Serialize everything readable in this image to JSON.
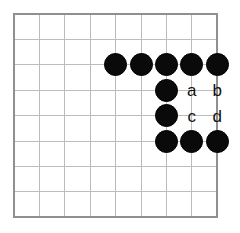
{
  "figure": {
    "kind": "go-board-diagram",
    "title": "",
    "caption": ""
  },
  "board": {
    "lines_x": 9,
    "lines_y": 9,
    "origin_x": 14,
    "origin_y": 14,
    "spacing": 25.4,
    "border_color": "#909090",
    "grid_color": "#bcbcbc",
    "background_color": "#ffffff",
    "border_width": 2,
    "grid_width": 1
  },
  "stones": {
    "diameter": 23,
    "black_color": "#0a0a0a",
    "white_color": "#ffffff",
    "items": [
      {
        "name": "stone-black-c4r2",
        "color": "black",
        "col": 4,
        "row": 2
      },
      {
        "name": "stone-black-c5r2",
        "color": "black",
        "col": 5,
        "row": 2
      },
      {
        "name": "stone-black-c6r2",
        "color": "black",
        "col": 6,
        "row": 2
      },
      {
        "name": "stone-black-c7r2",
        "color": "black",
        "col": 7,
        "row": 2
      },
      {
        "name": "stone-black-c8r2",
        "color": "black",
        "col": 8,
        "row": 2
      },
      {
        "name": "stone-black-c6r3",
        "color": "black",
        "col": 6,
        "row": 3
      },
      {
        "name": "stone-black-c6r4",
        "color": "black",
        "col": 6,
        "row": 4
      },
      {
        "name": "stone-black-c6r5",
        "color": "black",
        "col": 6,
        "row": 5
      },
      {
        "name": "stone-black-c7r5",
        "color": "black",
        "col": 7,
        "row": 5
      },
      {
        "name": "stone-black-c8r5",
        "color": "black",
        "col": 8,
        "row": 5
      }
    ]
  },
  "markers": {
    "font_size": 17,
    "color": "#111111",
    "items": [
      {
        "name": "marker-label-a",
        "label": "a",
        "col": 7,
        "row": 3
      },
      {
        "name": "marker-label-b",
        "label": "b",
        "col": 8,
        "row": 3
      },
      {
        "name": "marker-label-c",
        "label": "c",
        "col": 7,
        "row": 4
      },
      {
        "name": "marker-label-d",
        "label": "d",
        "col": 8,
        "row": 4
      }
    ]
  }
}
